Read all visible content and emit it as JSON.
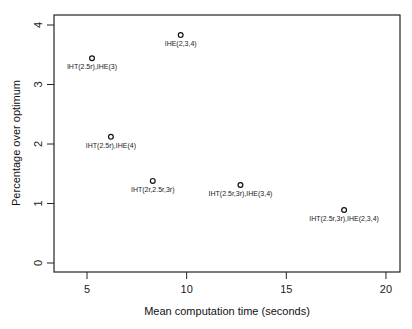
{
  "chart_data": {
    "type": "scatter",
    "title": "",
    "xlabel": "Mean computation time (seconds)",
    "ylabel": "Percentage over optimum",
    "xlim": [
      3.4,
      20.8
    ],
    "ylim": [
      -0.17,
      4.17
    ],
    "xticks": [
      5,
      10,
      15,
      20
    ],
    "yticks": [
      0,
      1,
      2,
      3,
      4
    ],
    "grid": false,
    "legend": null,
    "points": [
      {
        "label": "IHE(2,3,4)",
        "x": 9.7,
        "y": 3.83
      },
      {
        "label": "IHT(2.5r),IHE(3)",
        "x": 5.25,
        "y": 3.44
      },
      {
        "label": "IHT(2.5r),IHE(4)",
        "x": 6.2,
        "y": 2.12
      },
      {
        "label": "IHT(2r,2.5r,3r)",
        "x": 8.3,
        "y": 1.38
      },
      {
        "label": "IHT(2.5r,3r),IHE(3,4)",
        "x": 12.7,
        "y": 1.31
      },
      {
        "label": "IHT(2.5r,3r),IHE(2,3,4)",
        "x": 17.9,
        "y": 0.89
      }
    ]
  }
}
